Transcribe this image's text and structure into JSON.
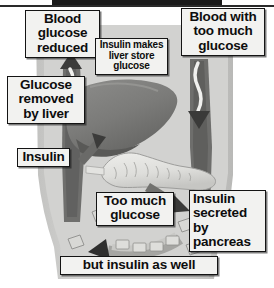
{
  "figure": {
    "domain_type": "anatomical-diagram",
    "palette": {
      "background": "#ffffff",
      "torso_fill": "#c9c9c7",
      "torso_inner": "#d4d4d2",
      "liver_fill": "#8e8e8c",
      "liver_shadow": "#6f6f6d",
      "pancreas_fill": "#e2e2df",
      "vessel_dark": "#5e5e5c",
      "vessel_mid": "#8a8a88",
      "callout_fill": "#f2f2f0",
      "callout_border": "#141414",
      "text": "#0d0d0d",
      "top_bar": "#1b1b1b"
    }
  },
  "callouts": [
    {
      "id": "blood-glucose-reduced",
      "text": "Blood\nglucose\nreduced",
      "size": "big",
      "align": "center"
    },
    {
      "id": "blood-too-much-glucose",
      "text": "Blood with\ntoo much\nglucose",
      "size": "big",
      "align": "center"
    },
    {
      "id": "insulin-liver-store",
      "text": "Insulin makes\nliver store\nglucose",
      "size": "small",
      "align": "center"
    },
    {
      "id": "glucose-removed-liver",
      "text": "Glucose\nremoved\nby liver",
      "size": "big",
      "align": "center"
    },
    {
      "id": "insulin",
      "text": "Insulin",
      "size": "big",
      "align": "center"
    },
    {
      "id": "too-much-glucose",
      "text": "Too much\nglucose",
      "size": "big",
      "align": "center"
    },
    {
      "id": "insulin-secreted",
      "text": "Insulin\nsecreted by\npancreas",
      "size": "big",
      "align": "left"
    },
    {
      "id": "but-insulin-as-well",
      "text": "but insulin as well",
      "size": "big",
      "align": "center"
    }
  ],
  "labels": {
    "blood_glucose_reduced": "Blood\nglucose\nreduced",
    "blood_too_much_glucose": "Blood with\ntoo much\nglucose",
    "insulin_liver_store": "Insulin makes\nliver store\nglucose",
    "glucose_removed_liver": "Glucose\nremoved\nby liver",
    "insulin": "Insulin",
    "too_much_glucose": "Too much\nglucose",
    "insulin_secreted_pancreas": "Insulin\nsecreted by\npancreas",
    "but_insulin_as_well": "but insulin as well"
  },
  "anatomy": [
    {
      "name": "torso",
      "description": "human torso silhouette, light gray"
    },
    {
      "name": "liver",
      "description": "large dark gray liver, upper middle-left"
    },
    {
      "name": "pancreas",
      "description": "elongated light gray pancreas, center-right"
    }
  ],
  "flow_arrows": [
    {
      "name": "left-vessel-up",
      "direction": "up",
      "tone": "dark",
      "meaning": "blood leaving liver with reduced glucose"
    },
    {
      "name": "right-vessel-down",
      "direction": "down",
      "tone": "dark",
      "meaning": "blood arriving with too much glucose"
    },
    {
      "name": "insulin-to-liver",
      "direction": "up-left",
      "tone": "dark",
      "meaning": "insulin travelling to the liver"
    },
    {
      "name": "pancreas-secretion",
      "direction": "down-right",
      "tone": "dark",
      "meaning": "insulin secreted by pancreas into blood"
    },
    {
      "name": "bottom-curved-flow",
      "direction": "left",
      "tone": "mid",
      "meaning": "glucose and insulin circulating"
    }
  ]
}
